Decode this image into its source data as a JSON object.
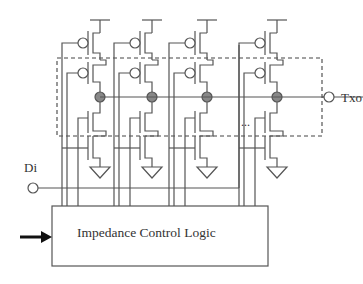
{
  "diagram": {
    "type": "circuit-schematic",
    "labels": {
      "input": "Di",
      "output": "Txo",
      "logic_block": "Impedance Control Logic",
      "ellipsis": "..."
    },
    "columns": [
      {
        "index": 1,
        "x": 100
      },
      {
        "index": 2,
        "x": 152
      },
      {
        "index": 3,
        "x": 207
      },
      {
        "index": 4,
        "x": 277
      }
    ],
    "components_per_column": [
      "PMOS (top)",
      "PMOS (enable)",
      "output node",
      "NMOS (enable)",
      "NMOS (bottom)",
      "ground"
    ],
    "colors": {
      "line": "#555555",
      "node_fill": "#888888",
      "arrow": "#111111",
      "text": "#333333"
    }
  }
}
